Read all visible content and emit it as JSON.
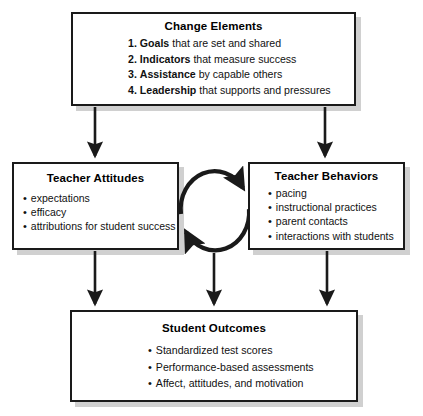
{
  "diagram": {
    "line_color": "#1a1a1a",
    "box_fill": "#ffffff",
    "shadow_color": "#a9a9a9"
  },
  "nodes": {
    "change_elements": {
      "title": "Change Elements",
      "items": [
        {
          "num": "1.",
          "strong": "Goals",
          "rest": " that are set and shared"
        },
        {
          "num": "2.",
          "strong": "Indicators",
          "rest": " that measure success"
        },
        {
          "num": "3.",
          "strong": "Assistance",
          "rest": " by capable others"
        },
        {
          "num": "4.",
          "strong": "Leadership",
          "rest": " that supports and pressures"
        }
      ]
    },
    "teacher_attitudes": {
      "title": "Teacher Attitudes",
      "items": [
        "expectations",
        "efficacy",
        "attributions for student success"
      ]
    },
    "teacher_behaviors": {
      "title": "Teacher Behaviors",
      "items": [
        "pacing",
        "instructional practices",
        "parent contacts",
        "interactions with students"
      ]
    },
    "student_outcomes": {
      "title": "Student Outcomes",
      "items": [
        "Standardized test scores",
        "Performance-based assessments",
        "Affect, attitudes, and motivation"
      ]
    }
  },
  "connectors": [
    {
      "name": "change-to-attitudes-arrow",
      "kind": "straight-down"
    },
    {
      "name": "change-to-behaviors-arrow",
      "kind": "straight-down"
    },
    {
      "name": "attitudes-to-behaviors-arrow",
      "kind": "arc-clockwise-top"
    },
    {
      "name": "behaviors-to-attitudes-arrow",
      "kind": "arc-clockwise-bottom"
    },
    {
      "name": "attitudes-to-outcomes-arrow",
      "kind": "straight-down"
    },
    {
      "name": "cycle-to-outcomes-arrow",
      "kind": "straight-down"
    },
    {
      "name": "behaviors-to-outcomes-arrow",
      "kind": "straight-down"
    }
  ]
}
